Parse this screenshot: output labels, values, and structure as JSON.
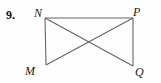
{
  "figure": {
    "problem_number": "9.",
    "shape_name": "quadrilateral-with-diagonals",
    "stroke_color": "#666666",
    "background_color": "#fdfdfd",
    "label_color": "#1a1a1a",
    "vertices": [
      {
        "id": "N",
        "label": "N",
        "x": 45,
        "y": 18,
        "position": "top-left"
      },
      {
        "id": "P",
        "label": "P",
        "x": 133,
        "y": 18,
        "position": "top-right"
      },
      {
        "id": "M",
        "label": "M",
        "x": 46,
        "y": 65,
        "position": "bottom-left"
      },
      {
        "id": "Q",
        "label": "Q",
        "x": 133,
        "y": 66,
        "position": "bottom-right"
      }
    ],
    "segments": [
      {
        "id": "NP",
        "from": "N",
        "to": "P",
        "kind": "side",
        "x1": 45,
        "y1": 18,
        "x2": 133,
        "y2": 18
      },
      {
        "id": "NM",
        "from": "N",
        "to": "M",
        "kind": "side",
        "x1": 45,
        "y1": 18,
        "x2": 46,
        "y2": 65
      },
      {
        "id": "PQ",
        "from": "P",
        "to": "Q",
        "kind": "side",
        "x1": 133,
        "y1": 18,
        "x2": 133,
        "y2": 66
      },
      {
        "id": "NQ",
        "from": "N",
        "to": "Q",
        "kind": "diagonal",
        "x1": 45,
        "y1": 18,
        "x2": 133,
        "y2": 66
      },
      {
        "id": "MP",
        "from": "M",
        "to": "P",
        "kind": "diagonal",
        "x1": 46,
        "y1": 65,
        "x2": 133,
        "y2": 18
      }
    ],
    "intersection": {
      "id": "diagonal-crossing",
      "x": 90,
      "y": 42
    }
  },
  "chart_data": {
    "type": "diagram",
    "title": "",
    "subtitle": "",
    "points": [
      {
        "name": "N",
        "x": 45,
        "y": 18
      },
      {
        "name": "P",
        "x": 133,
        "y": 18
      },
      {
        "name": "M",
        "x": 46,
        "y": 65
      },
      {
        "name": "Q",
        "x": 133,
        "y": 66
      }
    ],
    "edges": [
      "NP",
      "NM",
      "PQ",
      "NQ",
      "MP"
    ],
    "annotations": [
      "9."
    ],
    "legend": [],
    "grid": false
  }
}
